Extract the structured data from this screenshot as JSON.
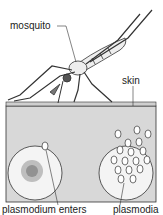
{
  "diagram": {
    "labels": {
      "mosquito": "mosquito",
      "skin": "skin",
      "plasmodium_enters": "plasmodium enters",
      "plasmodia": "plasmodia"
    },
    "colors": {
      "skin_fill": "#d8d8d8",
      "outline": "#333333",
      "cell_fill": "#f4f4f4",
      "background": "#ffffff"
    }
  }
}
